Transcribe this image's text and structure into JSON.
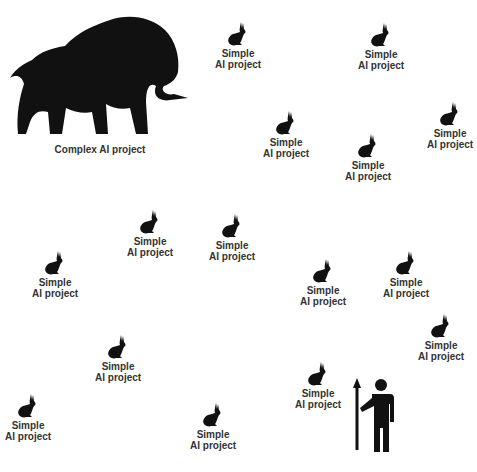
{
  "complex": {
    "label": "Complex AI project",
    "x": 10,
    "y": 10
  },
  "simple_label_line1": "Simple",
  "simple_label_line2": "AI project",
  "bunnies": [
    {
      "x": 215,
      "y": 22
    },
    {
      "x": 358,
      "y": 23
    },
    {
      "x": 263,
      "y": 111
    },
    {
      "x": 345,
      "y": 134
    },
    {
      "x": 427,
      "y": 102
    },
    {
      "x": 127,
      "y": 210
    },
    {
      "x": 209,
      "y": 214
    },
    {
      "x": 32,
      "y": 251
    },
    {
      "x": 300,
      "y": 259
    },
    {
      "x": 383,
      "y": 251
    },
    {
      "x": 95,
      "y": 335
    },
    {
      "x": 418,
      "y": 314
    },
    {
      "x": 295,
      "y": 362
    },
    {
      "x": 5,
      "y": 394
    },
    {
      "x": 190,
      "y": 403
    }
  ],
  "hunter": {
    "x": 352,
    "y": 376
  }
}
